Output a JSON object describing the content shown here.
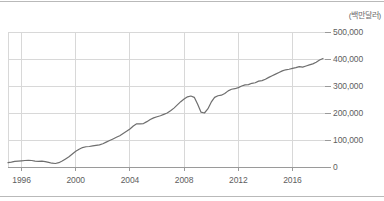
{
  "chart_data": {
    "type": "line",
    "title": "",
    "subtitle": "",
    "unit_label": "(백만달러)",
    "xlabel": "",
    "ylabel": "",
    "xlim": [
      1995.0,
      2018.4
    ],
    "ylim": [
      0,
      500000
    ],
    "grid": true,
    "legend": null,
    "legend_position": "none",
    "xticks": [
      "1996",
      "2000",
      "2004",
      "2008",
      "2012",
      "2016"
    ],
    "xtick_values": [
      1996,
      2000,
      2004,
      2008,
      2012,
      2016
    ],
    "yticks": [
      "0",
      "100,000",
      "200,000",
      "300,000",
      "400,000",
      "500,000"
    ],
    "ytick_values": [
      0,
      100000,
      200000,
      300000,
      400000,
      500000
    ],
    "series": [
      {
        "name": "",
        "color": "#6e6e6e",
        "x": [
          1995.0,
          1995.25,
          1995.5,
          1995.75,
          1996.0,
          1996.25,
          1996.5,
          1996.75,
          1997.0,
          1997.25,
          1997.5,
          1997.75,
          1998.0,
          1998.25,
          1998.5,
          1998.75,
          1999.0,
          1999.25,
          1999.5,
          1999.75,
          2000.0,
          2000.25,
          2000.5,
          2000.75,
          2001.0,
          2001.25,
          2001.5,
          2001.75,
          2002.0,
          2002.25,
          2002.5,
          2002.75,
          2003.0,
          2003.25,
          2003.5,
          2003.75,
          2004.0,
          2004.25,
          2004.5,
          2004.75,
          2005.0,
          2005.25,
          2005.5,
          2005.75,
          2006.0,
          2006.25,
          2006.5,
          2006.75,
          2007.0,
          2007.25,
          2007.5,
          2007.75,
          2008.0,
          2008.25,
          2008.5,
          2008.75,
          2009.0,
          2009.25,
          2009.5,
          2009.75,
          2010.0,
          2010.25,
          2010.5,
          2010.75,
          2011.0,
          2011.25,
          2011.5,
          2011.75,
          2012.0,
          2012.25,
          2012.5,
          2012.75,
          2013.0,
          2013.25,
          2013.5,
          2013.75,
          2014.0,
          2014.25,
          2014.5,
          2014.75,
          2015.0,
          2015.25,
          2015.5,
          2015.75,
          2016.0,
          2016.25,
          2016.5,
          2016.75,
          2017.0,
          2017.25,
          2017.5,
          2017.75,
          2018.0,
          2018.25
        ],
        "y": [
          16000,
          18000,
          21000,
          22000,
          23000,
          24000,
          25000,
          24000,
          22000,
          21000,
          22000,
          20000,
          17000,
          14000,
          13000,
          16000,
          22000,
          30000,
          38000,
          48000,
          58000,
          66000,
          72000,
          75000,
          76000,
          78000,
          80000,
          82000,
          86000,
          92000,
          98000,
          104000,
          110000,
          116000,
          124000,
          132000,
          141000,
          152000,
          160000,
          160000,
          161000,
          168000,
          176000,
          182000,
          186000,
          190000,
          195000,
          200000,
          208000,
          218000,
          230000,
          242000,
          252000,
          260000,
          263000,
          258000,
          232000,
          203000,
          200000,
          215000,
          240000,
          258000,
          264000,
          266000,
          272000,
          282000,
          288000,
          290000,
          294000,
          300000,
          304000,
          305000,
          310000,
          312000,
          318000,
          320000,
          325000,
          332000,
          338000,
          344000,
          350000,
          356000,
          360000,
          362000,
          365000,
          368000,
          372000,
          370000,
          374000,
          378000,
          382000,
          388000,
          396000,
          402000
        ]
      }
    ],
    "annotations": []
  },
  "colors": {
    "line": "#6e6e6e",
    "grid": "#d8d8d8",
    "rule": "#b9b9b9",
    "tick_text": "#5e5e5e",
    "unit_text": "#6b6b6b",
    "background": "#ffffff"
  }
}
